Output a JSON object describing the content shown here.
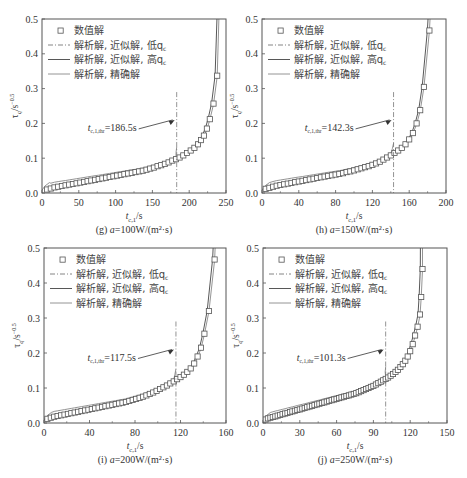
{
  "legend": {
    "items": [
      {
        "label": "数值解",
        "style": "square-marker"
      },
      {
        "label": "解析解, 近似解, 低q",
        "sub": "c",
        "style": "dash-dot"
      },
      {
        "label": "解析解, 近似解, 高q",
        "sub": "c",
        "style": "solid-dark"
      },
      {
        "label": "解析解, 精确解",
        "style": "solid-light"
      }
    ]
  },
  "colors": {
    "frame": "#555555",
    "numeric_marker": "#555555",
    "low_qc": "#777777",
    "high_qc": "#444444",
    "exact": "#888888",
    "threshold_line": "#777777"
  },
  "chart_data": [
    {
      "id": "g",
      "type": "line",
      "caption": "(g) a=100W/(m²·s)",
      "xlabel": "t_{c,1}/s",
      "ylabel": "τ_q/s^-0.5",
      "xlim": [
        0,
        250
      ],
      "ylim": [
        0,
        0.5
      ],
      "xticks": [
        0,
        50,
        100,
        150,
        200,
        250
      ],
      "yticks": [
        0.0,
        0.1,
        0.2,
        0.3,
        0.4,
        0.5
      ],
      "threshold": {
        "x": 183,
        "label": "t_{c,1,thr}=186.5s"
      },
      "t_end": 242,
      "numeric_points": [
        [
          7,
          0.01
        ],
        [
          12,
          0.013
        ],
        [
          17,
          0.016
        ],
        [
          22,
          0.018
        ],
        [
          27,
          0.02
        ],
        [
          32,
          0.022
        ],
        [
          37,
          0.024
        ],
        [
          42,
          0.026
        ],
        [
          47,
          0.028
        ],
        [
          52,
          0.03
        ],
        [
          57,
          0.032
        ],
        [
          62,
          0.034
        ],
        [
          67,
          0.036
        ],
        [
          72,
          0.038
        ],
        [
          77,
          0.04
        ],
        [
          82,
          0.042
        ],
        [
          87,
          0.044
        ],
        [
          92,
          0.046
        ],
        [
          97,
          0.048
        ],
        [
          102,
          0.05
        ],
        [
          107,
          0.052
        ],
        [
          112,
          0.054
        ],
        [
          117,
          0.056
        ],
        [
          122,
          0.058
        ],
        [
          127,
          0.06
        ],
        [
          132,
          0.062
        ],
        [
          137,
          0.064
        ],
        [
          142,
          0.067
        ],
        [
          147,
          0.07
        ],
        [
          152,
          0.073
        ],
        [
          157,
          0.077
        ],
        [
          162,
          0.08
        ],
        [
          167,
          0.084
        ],
        [
          172,
          0.088
        ],
        [
          177,
          0.093
        ],
        [
          182,
          0.097
        ],
        [
          187,
          0.102
        ],
        [
          192,
          0.108
        ],
        [
          197,
          0.115
        ],
        [
          202,
          0.122
        ],
        [
          207,
          0.13
        ],
        [
          212,
          0.14
        ],
        [
          216,
          0.152
        ],
        [
          220,
          0.165
        ],
        [
          224,
          0.185
        ],
        [
          228,
          0.212
        ],
        [
          233,
          0.257
        ],
        [
          238,
          0.337
        ]
      ],
      "series": [
        {
          "name": "解析解, 近似解, 低qc",
          "low_offset": 0.012
        },
        {
          "name": "解析解, 近似解, 高qc"
        },
        {
          "name": "解析解, 精确解"
        }
      ]
    },
    {
      "id": "h",
      "type": "line",
      "caption": "(h) a=150W/(m²·s)",
      "xlabel": "t_{c,1}/s",
      "ylabel": "τ_q/s^-0.5",
      "xlim": [
        0,
        200
      ],
      "ylim": [
        0,
        0.5
      ],
      "xticks": [
        0,
        40,
        80,
        120,
        160,
        200
      ],
      "yticks": [
        0.0,
        0.1,
        0.2,
        0.3,
        0.4,
        0.5
      ],
      "threshold": {
        "x": 143,
        "label": "t_{c,1,thr}=142.3s"
      },
      "t_end": 185,
      "numeric_points": [
        [
          4,
          0.012
        ],
        [
          8,
          0.015
        ],
        [
          12,
          0.018
        ],
        [
          16,
          0.021
        ],
        [
          20,
          0.023
        ],
        [
          24,
          0.025
        ],
        [
          28,
          0.027
        ],
        [
          32,
          0.029
        ],
        [
          36,
          0.031
        ],
        [
          40,
          0.033
        ],
        [
          44,
          0.035
        ],
        [
          48,
          0.037
        ],
        [
          52,
          0.039
        ],
        [
          56,
          0.041
        ],
        [
          60,
          0.043
        ],
        [
          64,
          0.045
        ],
        [
          68,
          0.047
        ],
        [
          72,
          0.049
        ],
        [
          76,
          0.051
        ],
        [
          80,
          0.053
        ],
        [
          84,
          0.055
        ],
        [
          88,
          0.057
        ],
        [
          92,
          0.06
        ],
        [
          96,
          0.062
        ],
        [
          100,
          0.065
        ],
        [
          104,
          0.068
        ],
        [
          108,
          0.071
        ],
        [
          112,
          0.074
        ],
        [
          116,
          0.077
        ],
        [
          120,
          0.081
        ],
        [
          124,
          0.085
        ],
        [
          128,
          0.09
        ],
        [
          132,
          0.096
        ],
        [
          136,
          0.102
        ],
        [
          140,
          0.108
        ],
        [
          144,
          0.115
        ],
        [
          148,
          0.122
        ],
        [
          152,
          0.13
        ],
        [
          156,
          0.14
        ],
        [
          160,
          0.154
        ],
        [
          164,
          0.172
        ],
        [
          168,
          0.2
        ],
        [
          172,
          0.238
        ],
        [
          176,
          0.305
        ],
        [
          182,
          0.467
        ]
      ]
    },
    {
      "id": "i",
      "type": "line",
      "caption": "(i) a=200W/(m²·s)",
      "xlabel": "t_{c,1}/s",
      "ylabel": "τ_q/s^-0.5",
      "xlim": [
        0,
        160
      ],
      "ylim": [
        0,
        0.5
      ],
      "xticks": [
        0,
        40,
        80,
        120,
        160
      ],
      "yticks": [
        0.0,
        0.1,
        0.2,
        0.3,
        0.4,
        0.5
      ],
      "threshold": {
        "x": 116,
        "label": "t_{c,1,thr}=117.5s"
      },
      "t_end": 152,
      "numeric_points": [
        [
          3,
          0.012
        ],
        [
          6,
          0.015
        ],
        [
          9,
          0.018
        ],
        [
          12,
          0.02
        ],
        [
          15,
          0.022
        ],
        [
          18,
          0.024
        ],
        [
          21,
          0.026
        ],
        [
          24,
          0.028
        ],
        [
          27,
          0.03
        ],
        [
          30,
          0.032
        ],
        [
          33,
          0.034
        ],
        [
          36,
          0.036
        ],
        [
          39,
          0.038
        ],
        [
          42,
          0.04
        ],
        [
          45,
          0.042
        ],
        [
          48,
          0.044
        ],
        [
          51,
          0.046
        ],
        [
          54,
          0.048
        ],
        [
          57,
          0.05
        ],
        [
          60,
          0.052
        ],
        [
          63,
          0.054
        ],
        [
          66,
          0.056
        ],
        [
          69,
          0.058
        ],
        [
          72,
          0.06
        ],
        [
          75,
          0.063
        ],
        [
          78,
          0.066
        ],
        [
          81,
          0.069
        ],
        [
          84,
          0.072
        ],
        [
          87,
          0.075
        ],
        [
          90,
          0.079
        ],
        [
          93,
          0.083
        ],
        [
          96,
          0.087
        ],
        [
          99,
          0.092
        ],
        [
          102,
          0.097
        ],
        [
          105,
          0.102
        ],
        [
          108,
          0.107
        ],
        [
          111,
          0.113
        ],
        [
          114,
          0.119
        ],
        [
          117,
          0.125
        ],
        [
          120,
          0.131
        ],
        [
          123,
          0.138
        ],
        [
          126,
          0.146
        ],
        [
          129,
          0.156
        ],
        [
          132,
          0.17
        ],
        [
          135,
          0.19
        ],
        [
          138,
          0.215
        ],
        [
          141,
          0.255
        ],
        [
          145,
          0.32
        ],
        [
          150,
          0.467
        ]
      ]
    },
    {
      "id": "j",
      "type": "line",
      "caption": "(j) a=250W/(m²·s)",
      "xlabel": "t_{c,1}/s",
      "ylabel": "τ_q/s^-0.5",
      "xlim": [
        0,
        150
      ],
      "ylim": [
        0,
        0.5
      ],
      "xticks": [
        0,
        30,
        60,
        90,
        120,
        150
      ],
      "yticks": [
        0.0,
        0.1,
        0.2,
        0.3,
        0.4,
        0.5
      ],
      "threshold": {
        "x": 100,
        "label": "t_{c,1,thr}=101.3s"
      },
      "t_end": 130,
      "numeric_points": [
        [
          2,
          0.01
        ],
        [
          4,
          0.013
        ],
        [
          6,
          0.015
        ],
        [
          8,
          0.017
        ],
        [
          10,
          0.019
        ],
        [
          12,
          0.021
        ],
        [
          14,
          0.023
        ],
        [
          16,
          0.025
        ],
        [
          18,
          0.027
        ],
        [
          20,
          0.029
        ],
        [
          22,
          0.031
        ],
        [
          24,
          0.033
        ],
        [
          26,
          0.035
        ],
        [
          28,
          0.037
        ],
        [
          30,
          0.039
        ],
        [
          32,
          0.041
        ],
        [
          34,
          0.043
        ],
        [
          36,
          0.045
        ],
        [
          38,
          0.047
        ],
        [
          40,
          0.049
        ],
        [
          42,
          0.051
        ],
        [
          44,
          0.053
        ],
        [
          46,
          0.055
        ],
        [
          48,
          0.057
        ],
        [
          50,
          0.059
        ],
        [
          52,
          0.061
        ],
        [
          54,
          0.063
        ],
        [
          56,
          0.065
        ],
        [
          58,
          0.067
        ],
        [
          60,
          0.069
        ],
        [
          62,
          0.071
        ],
        [
          64,
          0.073
        ],
        [
          66,
          0.075
        ],
        [
          68,
          0.077
        ],
        [
          70,
          0.079
        ],
        [
          72,
          0.081
        ],
        [
          74,
          0.083
        ],
        [
          76,
          0.085
        ],
        [
          78,
          0.088
        ],
        [
          80,
          0.091
        ],
        [
          82,
          0.094
        ],
        [
          84,
          0.097
        ],
        [
          86,
          0.1
        ],
        [
          88,
          0.103
        ],
        [
          90,
          0.106
        ],
        [
          92,
          0.11
        ],
        [
          94,
          0.114
        ],
        [
          96,
          0.118
        ],
        [
          98,
          0.122
        ],
        [
          100,
          0.126
        ],
        [
          102,
          0.13
        ],
        [
          104,
          0.135
        ],
        [
          106,
          0.14
        ],
        [
          108,
          0.146
        ],
        [
          110,
          0.152
        ],
        [
          112,
          0.16
        ],
        [
          114,
          0.168
        ],
        [
          116,
          0.178
        ],
        [
          118,
          0.19
        ],
        [
          120,
          0.205
        ],
        [
          122,
          0.225
        ],
        [
          124,
          0.25
        ],
        [
          126,
          0.275
        ],
        [
          128,
          0.31
        ],
        [
          129,
          0.36
        ],
        [
          130,
          0.44
        ]
      ]
    }
  ]
}
